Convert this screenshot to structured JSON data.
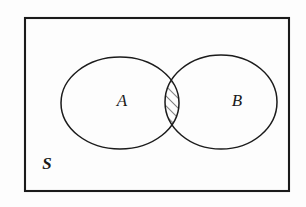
{
  "figure": {
    "kind": "venn-diagram",
    "background_color": "#fdfdfd",
    "stroke_color": "#1b1b1b",
    "hatch_color": "#1b1b1b"
  },
  "universe": {
    "label": "S",
    "label_x": 47,
    "label_y": 169,
    "rect": {
      "x": 25,
      "y": 18,
      "width": 264,
      "height": 173
    },
    "stroke_width": 2.1
  },
  "sets": [
    {
      "id": "set-a",
      "label": "A",
      "label_x": 122,
      "label_y": 106,
      "cx": 120,
      "cy": 103,
      "rx": 59,
      "ry": 46,
      "stroke_width": 1.5
    },
    {
      "id": "set-b",
      "label": "B",
      "label_x": 237,
      "label_y": 106,
      "cx": 221,
      "cy": 102,
      "rx": 56,
      "ry": 47,
      "stroke_width": 1.5
    }
  ],
  "intersection": {
    "label": "A intersect B",
    "shaded": true,
    "hatch_pattern": "diagonal-45-up-right",
    "hatch_spacing_px": 7,
    "hatch_stroke_width": 1.1,
    "crossing_top": {
      "x": 166,
      "y": 64
    },
    "crossing_bottom": {
      "x": 166,
      "y": 142
    }
  },
  "chart_data": {
    "type": "venn",
    "universe": "S",
    "sets": [
      "A",
      "B"
    ],
    "shaded_regions": [
      "A ∩ B"
    ],
    "region_labels": [
      "A",
      "B",
      "S"
    ],
    "legend": [],
    "grid": false
  }
}
